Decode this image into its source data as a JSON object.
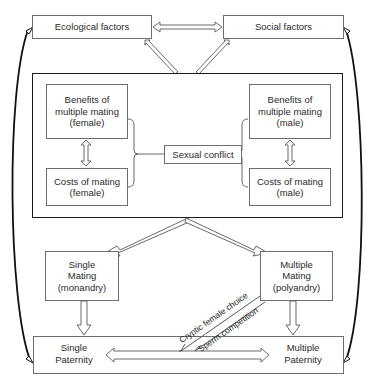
{
  "diagram": {
    "top": {
      "ecological": "Ecological factors",
      "social": "Social factors"
    },
    "conflict_panel": {
      "benefits_female": "Benefits of multiple mating (female)",
      "costs_female": "Costs of mating (female)",
      "sexual_conflict": "Sexual conflict",
      "benefits_male": "Benefits of multiple mating (male)",
      "costs_male": "Costs of mating (male)"
    },
    "mating": {
      "single": "Single Mating (monandry)",
      "multiple": "Multiple Mating (polyandry)"
    },
    "paternity": {
      "single": "Single Paternity",
      "multiple": "Multiple Paternity"
    },
    "mechanisms": {
      "cryptic": "Cryptic female choice",
      "sperm": "Sperm competition"
    },
    "colors": {
      "box_border": "#6e6e6e",
      "panel_border": "#1a1a1a",
      "arrow_stroke": "#555555",
      "feedback_arrow": "#111111"
    }
  }
}
